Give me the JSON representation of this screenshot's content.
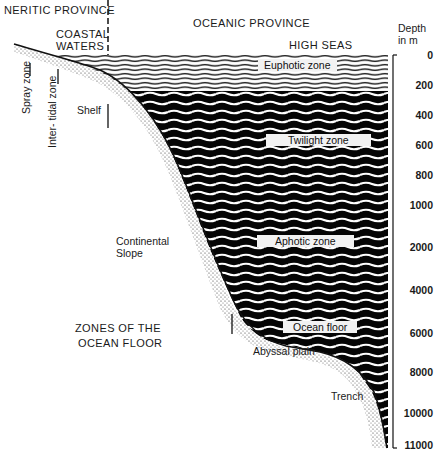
{
  "header": {
    "neritic_province": "NERITIC PROVINCE",
    "oceanic_province": "OCEANIC PROVINCE",
    "coastal_waters_line1": "COASTAL",
    "coastal_waters_line2": "WATERS",
    "high_seas": "HIGH SEAS"
  },
  "depth_axis": {
    "title_line1": "Depth",
    "title_line2": "in m",
    "ticks": [
      {
        "label": "0",
        "y": 55
      },
      {
        "label": "200",
        "y": 85
      },
      {
        "label": "400",
        "y": 115
      },
      {
        "label": "600",
        "y": 145
      },
      {
        "label": "800",
        "y": 175
      },
      {
        "label": "1000",
        "y": 205
      },
      {
        "label": "2000",
        "y": 247
      },
      {
        "label": "4000",
        "y": 290
      },
      {
        "label": "6000",
        "y": 333
      },
      {
        "label": "8000",
        "y": 372
      },
      {
        "label": "10000",
        "y": 413
      },
      {
        "label": "11000",
        "y": 445
      }
    ]
  },
  "water_zones": {
    "euphotic": "Euphotic zone",
    "twilight": "Twilight zone",
    "aphotic": "Aphotic zone",
    "ocean_floor": "Ocean floor"
  },
  "floor_zones": {
    "spray_zone": "Spray zone",
    "intertidal_zone": "Inter- tidal zone",
    "shelf": "Shelf",
    "continental_slope_line1": "Continental",
    "continental_slope_line2": "Slope",
    "abyssal_plain": "Abyssal plain",
    "trench": "Trench",
    "section_title_line1": "ZONES OF THE",
    "section_title_line2": "OCEAN FLOOR"
  },
  "colors": {
    "water_dark": "#050505",
    "wave_light": "#ffffff",
    "label_box": "#f2f2f2",
    "sediment_dots": "#333333"
  }
}
